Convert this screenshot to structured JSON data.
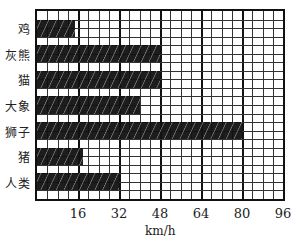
{
  "chart_data": {
    "type": "bar",
    "orientation": "horizontal",
    "title": "",
    "xlabel": "km/h",
    "ylabel": "",
    "categories": [
      "鸡",
      "灰熊",
      "猫",
      "大象",
      "狮子",
      "猪",
      "人类"
    ],
    "values": [
      15,
      48,
      48,
      40,
      80,
      18,
      32
    ],
    "xlim": [
      0,
      96
    ],
    "xticks": [
      16,
      32,
      48,
      64,
      80,
      96
    ],
    "grid": true,
    "grid_step": 4,
    "legend": null,
    "bar_fill": "hatched black"
  },
  "axis": {
    "xlabel": "km/h",
    "ticks": [
      "16",
      "32",
      "48",
      "64",
      "80",
      "96"
    ]
  },
  "labels": [
    "鸡",
    "灰熊",
    "猫",
    "大象",
    "狮子",
    "猪",
    "人类"
  ]
}
